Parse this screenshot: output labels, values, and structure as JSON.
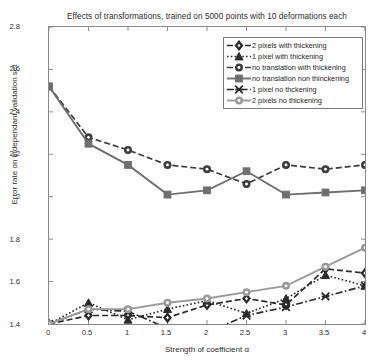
{
  "chart_data": {
    "type": "line",
    "title": "Effects of transformations, trained on 5000 points with 10 deformations each",
    "xlabel": "Strength of coefficient α",
    "ylabel": "Error rate on independant validation set",
    "x": [
      0,
      0.5,
      1,
      1.5,
      2,
      2.5,
      3,
      3.5,
      4
    ],
    "xlim": [
      0,
      4
    ],
    "ylim": [
      1.4,
      2.8
    ],
    "xticks": [
      "0",
      "0.5",
      "1",
      "1.5",
      "2",
      "2.5",
      "3",
      "3.5",
      "4"
    ],
    "yticks": [
      "1.4",
      "1.6",
      "1.8",
      "2",
      "2.2",
      "2.4",
      "2.6",
      "2.8"
    ],
    "grid": false,
    "legend_position": "upper right",
    "series": [
      {
        "name": "2 pixels with thickening",
        "marker": "diamond",
        "linestyle": "dashed",
        "color": "#2b2b2b",
        "values": [
          1.4,
          1.44,
          1.44,
          1.43,
          1.49,
          1.52,
          1.49,
          1.66,
          1.64
        ]
      },
      {
        "name": "1 pixel with thickening",
        "marker": "triangle",
        "linestyle": "dotted",
        "color": "#2b2b2b",
        "values": [
          1.4,
          1.5,
          1.42,
          1.47,
          1.51,
          1.45,
          1.52,
          1.63,
          1.58
        ]
      },
      {
        "name": "no translation with thickening",
        "marker": "circle",
        "linestyle": "dashed",
        "color": "#3d3d3d",
        "values": [
          2.52,
          2.28,
          2.22,
          2.15,
          2.13,
          2.06,
          2.15,
          2.13,
          2.15
        ]
      },
      {
        "name": "no translation non thinckening",
        "marker": "square",
        "linestyle": "solid",
        "color": "#6f6f6f",
        "values": [
          2.52,
          2.25,
          2.15,
          2.01,
          2.03,
          2.12,
          2.01,
          2.02,
          2.03
        ]
      },
      {
        "name": "1 pixel no thckening",
        "marker": "x",
        "linestyle": "dashdot",
        "color": "#2b2b2b",
        "values": [
          1.4,
          1.47,
          1.46,
          1.38,
          1.36,
          1.44,
          1.48,
          1.53,
          1.58
        ]
      },
      {
        "name": "2 pixels no thickening",
        "marker": "circle-open",
        "linestyle": "solid",
        "color": "#9a9a9a",
        "values": [
          1.4,
          1.47,
          1.47,
          1.5,
          1.52,
          1.55,
          1.58,
          1.67,
          1.76
        ]
      }
    ]
  },
  "legend": {
    "items": [
      {
        "label": "2 pixels with thickening"
      },
      {
        "label": "1 pixel with thickening"
      },
      {
        "label": "no translation with thickening"
      },
      {
        "label": "no translation non thinckening"
      },
      {
        "label": "1 pixel no thckening"
      },
      {
        "label": "2 pixels no thickening"
      }
    ]
  },
  "axes": {
    "ytick_labels": [
      "2.8",
      "2.6",
      "2.4",
      "2.2",
      "2",
      "1.8",
      "1.6",
      "1.4"
    ],
    "xtick_labels": [
      "0",
      "0.5",
      "1",
      "1.5",
      "2",
      "2.5",
      "3",
      "3.5",
      "4"
    ]
  }
}
